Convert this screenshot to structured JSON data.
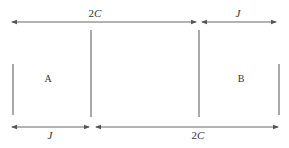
{
  "diagram": {
    "colors": {
      "line": "#555555",
      "text": "#333333",
      "background": "#ffffff"
    },
    "top_dimensions": [
      {
        "label": "2C",
        "italic_part": "C",
        "prefix": "2"
      },
      {
        "label": "J",
        "italic_part": "J",
        "prefix": ""
      }
    ],
    "bottom_dimensions": [
      {
        "label": "J",
        "italic_part": "J",
        "prefix": ""
      },
      {
        "label": "2C",
        "italic_part": "C",
        "prefix": "2"
      }
    ],
    "regions": [
      {
        "label": "A"
      },
      {
        "label": "B"
      }
    ]
  }
}
